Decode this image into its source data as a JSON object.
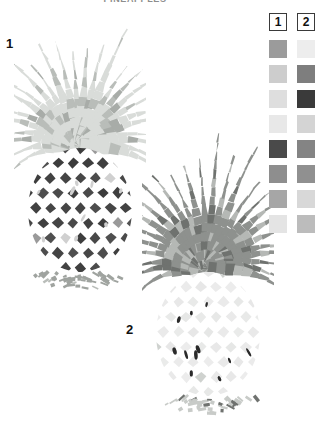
{
  "title": "PINEAPPLES",
  "background": "#ffffff",
  "figures": [
    {
      "label": "1",
      "name": "pineapple-stage-1",
      "crown_color": "#d9dcd9",
      "crown_accent": "#b9bdb9",
      "crown_shadow": "#a8aca8",
      "body_color": "#3c3c3c",
      "body_grid": "#ffffff",
      "body_accent": "#9a9a9a",
      "body_highlight": "#d0d0d0",
      "base_color": "#9fa39f"
    },
    {
      "label": "2",
      "name": "pineapple-stage-2",
      "crown_color": "#8e918e",
      "crown_accent": "#6f726f",
      "crown_shadow": "#b5b8b5",
      "body_color": "#ececec",
      "body_grid": "#ffffff",
      "body_accent": "#cfd2cf",
      "body_highlight": "#2a2a2a",
      "base_color": "#c8cbc8"
    }
  ],
  "legend": {
    "name": "color-key",
    "columns": [
      {
        "header": "1"
      },
      {
        "header": "2"
      }
    ],
    "rows": [
      {
        "col1": "#9b9b9b",
        "col2": "#ededed"
      },
      {
        "col1": "#cdcdcd",
        "col2": "#7e7e7e"
      },
      {
        "col1": "#dedede",
        "col2": "#3a3a3a"
      },
      {
        "col1": "#e8e8e8",
        "col2": "#d4d4d4"
      },
      {
        "col1": "#4a4a4a",
        "col2": "#848484"
      },
      {
        "col1": "#8e8e8e",
        "col2": "#909090"
      },
      {
        "col1": "#a6a6a6",
        "col2": "#d8d8d8"
      },
      {
        "col1": "#e4e4e4",
        "col2": "#bcbcbc"
      }
    ]
  }
}
